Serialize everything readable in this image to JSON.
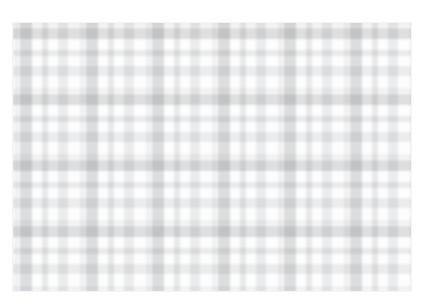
{
  "page": {
    "background_color": "#ffffff",
    "width": 427,
    "height": 308
  },
  "header": {
    "note": "clipped single line of faint grey text along the very top edge, only the lower pixel-sliver of the glyphs is visible",
    "visible_fragments": [
      "— ——",
      "—— ——",
      "— ——— ——",
      "——— —— — —"
    ],
    "text_color": "#f0f0f1"
  },
  "swatch": {
    "label": "tartan-pattern-swatch",
    "x": 12,
    "y": 22,
    "width": 400,
    "height": 270,
    "base_color": "#fdfdfd",
    "edge_color": "#f4f4f5",
    "repeat_px": 66,
    "pattern_type": "tartan / plaid",
    "warp_stripes": [
      {
        "name": "hairline",
        "offset": 2,
        "width": 5,
        "color": "#ebecee"
      },
      {
        "name": "wide",
        "offset": 8,
        "width": 12,
        "color": "#c4c6c9"
      },
      {
        "name": "narrow-a",
        "offset": 30,
        "width": 6,
        "color": "#d6d8db"
      },
      {
        "name": "narrow-b",
        "offset": 46,
        "width": 10,
        "color": "#dee0e3"
      }
    ],
    "weft_stripes": [
      {
        "name": "hairline",
        "offset": 0,
        "width": 5,
        "color": "#ecedef"
      },
      {
        "name": "wide",
        "offset": 6,
        "width": 11,
        "color": "#c6c8cb"
      },
      {
        "name": "narrow-a",
        "offset": 28,
        "width": 6,
        "color": "#d8dadd"
      },
      {
        "name": "narrow-b",
        "offset": 44,
        "width": 10,
        "color": "#dfe1e4"
      }
    ],
    "blend_mode": "multiply"
  }
}
